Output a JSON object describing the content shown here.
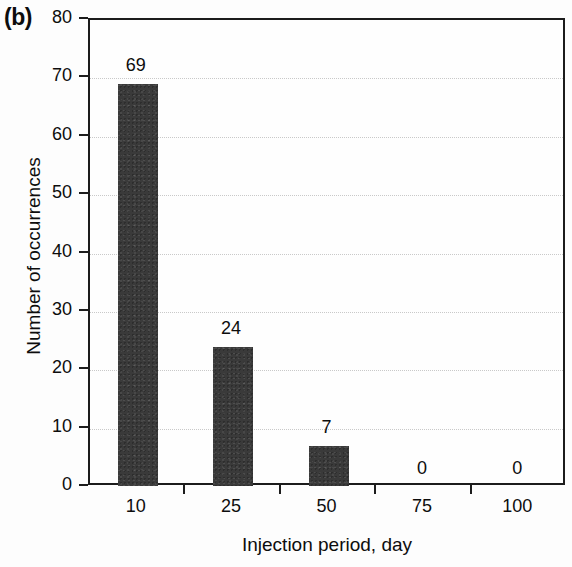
{
  "panel": {
    "label": "(b)"
  },
  "chart_data": {
    "type": "bar",
    "title": "",
    "panel_label": "(b)",
    "categories": [
      "10",
      "25",
      "50",
      "75",
      "100"
    ],
    "values": [
      69,
      24,
      7,
      0,
      0
    ],
    "data_labels": [
      "69",
      "24",
      "7",
      "0",
      "0"
    ],
    "xlabel": "Injection period, day",
    "ylabel": "Number of occurrences",
    "ylim": [
      0,
      80
    ],
    "ytick_labels": [
      "0",
      "10",
      "20",
      "30",
      "40",
      "50",
      "60",
      "70",
      "80"
    ],
    "ytick_values": [
      0,
      10,
      20,
      30,
      40,
      50,
      60,
      70,
      80
    ],
    "grid": true,
    "legend": null,
    "bar_color": "#3a3a3a",
    "axis_color": "#1c1c1c",
    "grid_color": "#c9c9c9"
  }
}
